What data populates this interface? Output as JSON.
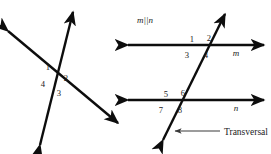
{
  "figure": {
    "stroke_color": "#0d0d0d",
    "background_color": "#ffffff",
    "left_diagram": {
      "name": "two-intersecting-lines",
      "description": "Two lines crossing at one point forming four numbered angles",
      "intersection": {
        "x": 57,
        "y": 78
      },
      "lines": [
        {
          "name": "steep-line",
          "from": {
            "x": 40,
            "y": 145
          },
          "to": {
            "x": 73,
            "y": 12
          },
          "arrows": "both"
        },
        {
          "name": "shallow-line",
          "from": {
            "x": 8,
            "y": 31
          },
          "to": {
            "x": 118,
            "y": 123
          },
          "arrows": "both"
        }
      ],
      "angle_labels": [
        {
          "id": "1",
          "text": "1",
          "x": 48,
          "y": 70
        },
        {
          "id": "2",
          "text": "2",
          "x": 65,
          "y": 80
        },
        {
          "id": "3",
          "text": "3",
          "x": 58,
          "y": 94
        },
        {
          "id": "4",
          "text": "4",
          "x": 42,
          "y": 85
        }
      ]
    },
    "right_diagram": {
      "name": "parallel-lines-transversal",
      "description": "Parallel lines m and n cut by a transversal forming eight numbered angles",
      "parallel_note": "m||n",
      "parallel_note_pos": {
        "x": 137,
        "y": 22
      },
      "lines": [
        {
          "name": "line-m",
          "label": "m",
          "y": 45,
          "x1": 128,
          "x2": 264,
          "label_x": 236,
          "label_y": 55,
          "arrows": "both"
        },
        {
          "name": "line-n",
          "label": "n",
          "y": 100,
          "x1": 128,
          "x2": 264,
          "label_x": 236,
          "label_y": 110,
          "arrows": "both"
        },
        {
          "name": "transversal",
          "label": "Transversal",
          "from": {
            "x": 163,
            "y": 140
          },
          "to": {
            "x": 225,
            "y": 14
          },
          "arrows": "both"
        }
      ],
      "angle_labels": [
        {
          "id": "1",
          "text": "1",
          "x": 190,
          "y": 41
        },
        {
          "id": "2",
          "text": "2",
          "x": 208,
          "y": 40
        },
        {
          "id": "3",
          "text": "3",
          "x": 186,
          "y": 57
        },
        {
          "id": "4",
          "text": "4",
          "x": 205,
          "y": 57
        },
        {
          "id": "5",
          "text": "5",
          "x": 164,
          "y": 96
        },
        {
          "id": "6",
          "text": "6",
          "x": 181,
          "y": 95
        },
        {
          "id": "7",
          "text": "7",
          "x": 160,
          "y": 112
        },
        {
          "id": "8",
          "text": "8",
          "x": 178,
          "y": 112
        }
      ],
      "callout": {
        "name": "transversal-callout",
        "text": "Transversal",
        "arrow_from": {
          "x": 220,
          "y": 131
        },
        "arrow_to": {
          "x": 174,
          "y": 131
        },
        "text_x": 224,
        "text_y": 135
      }
    }
  }
}
